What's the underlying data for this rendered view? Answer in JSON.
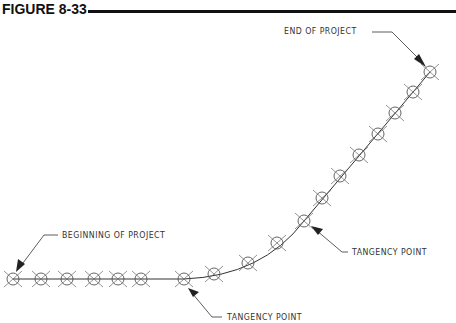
{
  "figure": {
    "title": "FIGURE 8-33"
  },
  "labels": {
    "end": "END OF PROJECT",
    "beginning": "BEGINNING OF PROJECT",
    "tangency_upper": "TANGENCY POINT",
    "tangency_lower": "TANGENCY POINT"
  },
  "markers": {
    "straight": [
      [
        13,
        279
      ],
      [
        41,
        279
      ],
      [
        67,
        279
      ],
      [
        94,
        279
      ],
      [
        118,
        279
      ],
      [
        141,
        279
      ],
      [
        184,
        279
      ]
    ],
    "curve": [
      [
        214,
        274
      ],
      [
        248,
        263
      ],
      [
        277,
        243
      ]
    ],
    "diagonal": [
      [
        304,
        221
      ],
      [
        322,
        198
      ],
      [
        340,
        176
      ],
      [
        359,
        155
      ],
      [
        378,
        134
      ],
      [
        395,
        113
      ],
      [
        413,
        92
      ],
      [
        430,
        72
      ]
    ]
  },
  "colors": {
    "line": "#333333",
    "marker": "#555555",
    "text": "#333333"
  }
}
